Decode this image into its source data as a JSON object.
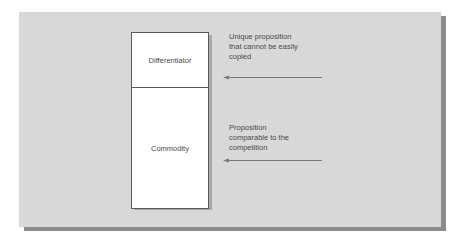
{
  "diagram": {
    "type": "layered-proposition-stack",
    "colors": {
      "background": "#ffffff",
      "panel": "#d8d8d8",
      "panel_shadow": "#8c8c8c",
      "box_fill": "#ffffff",
      "box_border": "#5a5a5a",
      "text": "#4a4a4a",
      "arrow": "#7a7a7a"
    },
    "stack": {
      "segments": [
        {
          "id": "differentiator",
          "label": "Differentiator"
        },
        {
          "id": "commodity",
          "label": "Commodity"
        }
      ]
    },
    "annotations": [
      {
        "target": "differentiator",
        "lines": [
          "Unique proposition",
          "that cannot be easily",
          "copied"
        ],
        "arrow_direction": "left"
      },
      {
        "target": "commodity",
        "lines": [
          "Proposition",
          "comparable to the",
          "competition"
        ],
        "arrow_direction": "left"
      }
    ]
  }
}
